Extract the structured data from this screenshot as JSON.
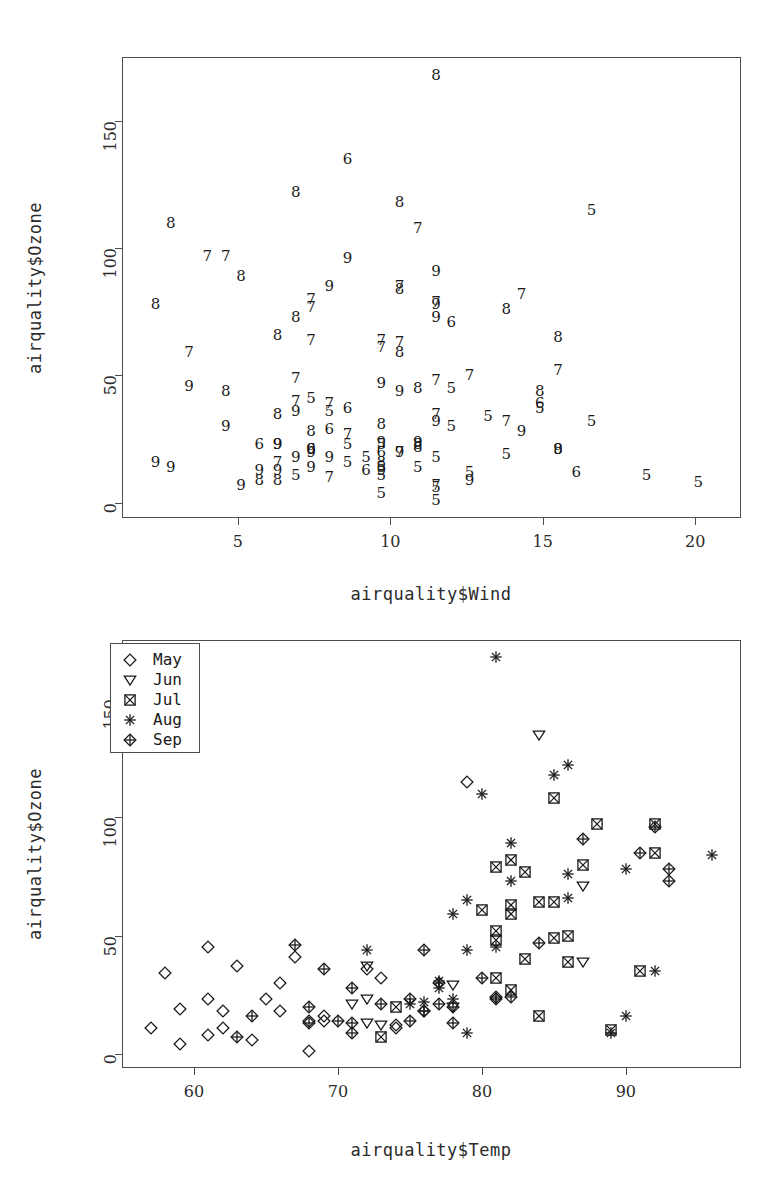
{
  "top_note": "",
  "chart_data": [
    {
      "type": "scatter",
      "id": "ozone-vs-wind",
      "title": "",
      "xlabel": "airquality$Wind",
      "ylabel": "airquality$Ozone",
      "xlim": [
        1.2,
        21.5
      ],
      "ylim": [
        -6,
        175
      ],
      "xticks": [
        5,
        10,
        15,
        20
      ],
      "yticks": [
        0,
        50,
        100,
        150
      ],
      "grid": false,
      "marker_style": "month-number-glyph",
      "note": "plot character is the month number (5=May .. 9=Sep)",
      "points": [
        {
          "x": 7.4,
          "y": 41,
          "m": 5
        },
        {
          "x": 8.0,
          "y": 36,
          "m": 5
        },
        {
          "x": 12.6,
          "y": 12,
          "m": 5
        },
        {
          "x": 11.5,
          "y": 18,
          "m": 5
        },
        {
          "x": 8.6,
          "y": 23,
          "m": 5
        },
        {
          "x": 13.8,
          "y": 19,
          "m": 5
        },
        {
          "x": 20.1,
          "y": 8,
          "m": 5
        },
        {
          "x": 8.6,
          "y": 16,
          "m": 5
        },
        {
          "x": 6.9,
          "y": 11,
          "m": 5
        },
        {
          "x": 9.7,
          "y": 14,
          "m": 5
        },
        {
          "x": 9.2,
          "y": 18,
          "m": 5
        },
        {
          "x": 10.9,
          "y": 14,
          "m": 5
        },
        {
          "x": 13.2,
          "y": 34,
          "m": 5
        },
        {
          "x": 11.5,
          "y": 6,
          "m": 5
        },
        {
          "x": 12.0,
          "y": 30,
          "m": 5
        },
        {
          "x": 18.4,
          "y": 11,
          "m": 5
        },
        {
          "x": 11.5,
          "y": 1,
          "m": 5
        },
        {
          "x": 9.7,
          "y": 11,
          "m": 5
        },
        {
          "x": 9.7,
          "y": 4,
          "m": 5
        },
        {
          "x": 16.6,
          "y": 32,
          "m": 5
        },
        {
          "x": 9.7,
          "y": 23,
          "m": 5
        },
        {
          "x": 12.0,
          "y": 45,
          "m": 5
        },
        {
          "x": 16.6,
          "y": 115,
          "m": 5
        },
        {
          "x": 14.9,
          "y": 37,
          "m": 5
        },
        {
          "x": 8.0,
          "y": 29,
          "m": 6
        },
        {
          "x": 12.0,
          "y": 71,
          "m": 6
        },
        {
          "x": 14.9,
          "y": 39,
          "m": 6
        },
        {
          "x": 5.7,
          "y": 23,
          "m": 6
        },
        {
          "x": 7.4,
          "y": 21,
          "m": 6
        },
        {
          "x": 8.6,
          "y": 37,
          "m": 6
        },
        {
          "x": 9.7,
          "y": 20,
          "m": 6
        },
        {
          "x": 16.1,
          "y": 12,
          "m": 6
        },
        {
          "x": 9.2,
          "y": 13,
          "m": 6
        },
        {
          "x": 8.6,
          "y": 135,
          "m": 6
        },
        {
          "x": 6.9,
          "y": 49,
          "m": 7
        },
        {
          "x": 13.8,
          "y": 32,
          "m": 7
        },
        {
          "x": 7.4,
          "y": 64,
          "m": 7
        },
        {
          "x": 6.9,
          "y": 40,
          "m": 7
        },
        {
          "x": 7.4,
          "y": 77,
          "m": 7
        },
        {
          "x": 4.6,
          "y": 97,
          "m": 7
        },
        {
          "x": 4.0,
          "y": 97,
          "m": 7
        },
        {
          "x": 10.3,
          "y": 85,
          "m": 7
        },
        {
          "x": 8.0,
          "y": 10,
          "m": 7
        },
        {
          "x": 8.6,
          "y": 27,
          "m": 7
        },
        {
          "x": 11.5,
          "y": 7,
          "m": 7
        },
        {
          "x": 11.5,
          "y": 48,
          "m": 7
        },
        {
          "x": 11.5,
          "y": 35,
          "m": 7
        },
        {
          "x": 9.7,
          "y": 61,
          "m": 7
        },
        {
          "x": 11.5,
          "y": 79,
          "m": 7
        },
        {
          "x": 10.3,
          "y": 63,
          "m": 7
        },
        {
          "x": 6.3,
          "y": 16,
          "m": 7
        },
        {
          "x": 7.4,
          "y": 80,
          "m": 7
        },
        {
          "x": 10.9,
          "y": 108,
          "m": 7
        },
        {
          "x": 10.3,
          "y": 20,
          "m": 7
        },
        {
          "x": 15.5,
          "y": 52,
          "m": 7
        },
        {
          "x": 14.3,
          "y": 82,
          "m": 7
        },
        {
          "x": 12.6,
          "y": 50,
          "m": 7
        },
        {
          "x": 9.7,
          "y": 64,
          "m": 7
        },
        {
          "x": 3.4,
          "y": 59,
          "m": 7
        },
        {
          "x": 8.0,
          "y": 39,
          "m": 7
        },
        {
          "x": 5.7,
          "y": 9,
          "m": 8
        },
        {
          "x": 9.7,
          "y": 16,
          "m": 8
        },
        {
          "x": 2.3,
          "y": 78,
          "m": 8
        },
        {
          "x": 6.3,
          "y": 35,
          "m": 8
        },
        {
          "x": 6.3,
          "y": 66,
          "m": 8
        },
        {
          "x": 6.9,
          "y": 122,
          "m": 8
        },
        {
          "x": 5.1,
          "y": 89,
          "m": 8
        },
        {
          "x": 2.8,
          "y": 110,
          "m": 8
        },
        {
          "x": 4.6,
          "y": 44,
          "m": 8
        },
        {
          "x": 7.4,
          "y": 28,
          "m": 8
        },
        {
          "x": 15.5,
          "y": 65,
          "m": 8
        },
        {
          "x": 10.9,
          "y": 22,
          "m": 8
        },
        {
          "x": 10.3,
          "y": 59,
          "m": 8
        },
        {
          "x": 10.9,
          "y": 23,
          "m": 8
        },
        {
          "x": 9.7,
          "y": 31,
          "m": 8
        },
        {
          "x": 14.9,
          "y": 44,
          "m": 8
        },
        {
          "x": 15.5,
          "y": 21,
          "m": 8
        },
        {
          "x": 6.3,
          "y": 9,
          "m": 8
        },
        {
          "x": 10.9,
          "y": 45,
          "m": 8
        },
        {
          "x": 11.5,
          "y": 168,
          "m": 8
        },
        {
          "x": 6.9,
          "y": 73,
          "m": 8
        },
        {
          "x": 13.8,
          "y": 76,
          "m": 8
        },
        {
          "x": 10.3,
          "y": 118,
          "m": 8
        },
        {
          "x": 10.3,
          "y": 84,
          "m": 8
        },
        {
          "x": 8.0,
          "y": 85,
          "m": 9
        },
        {
          "x": 8.6,
          "y": 96,
          "m": 9
        },
        {
          "x": 11.5,
          "y": 78,
          "m": 9
        },
        {
          "x": 11.5,
          "y": 73,
          "m": 9
        },
        {
          "x": 11.5,
          "y": 91,
          "m": 9
        },
        {
          "x": 9.7,
          "y": 47,
          "m": 9
        },
        {
          "x": 11.5,
          "y": 32,
          "m": 9
        },
        {
          "x": 10.3,
          "y": 20,
          "m": 9
        },
        {
          "x": 6.3,
          "y": 23,
          "m": 9
        },
        {
          "x": 7.4,
          "y": 21,
          "m": 9
        },
        {
          "x": 10.9,
          "y": 24,
          "m": 9
        },
        {
          "x": 10.3,
          "y": 44,
          "m": 9
        },
        {
          "x": 15.5,
          "y": 21,
          "m": 9
        },
        {
          "x": 14.3,
          "y": 28,
          "m": 9
        },
        {
          "x": 12.6,
          "y": 9,
          "m": 9
        },
        {
          "x": 9.7,
          "y": 13,
          "m": 9
        },
        {
          "x": 3.4,
          "y": 46,
          "m": 9
        },
        {
          "x": 8.0,
          "y": 18,
          "m": 9
        },
        {
          "x": 5.7,
          "y": 13,
          "m": 9
        },
        {
          "x": 9.7,
          "y": 24,
          "m": 9
        },
        {
          "x": 2.3,
          "y": 16,
          "m": 9
        },
        {
          "x": 6.3,
          "y": 13,
          "m": 9
        },
        {
          "x": 6.3,
          "y": 23,
          "m": 9
        },
        {
          "x": 6.9,
          "y": 36,
          "m": 9
        },
        {
          "x": 5.1,
          "y": 7,
          "m": 9
        },
        {
          "x": 2.8,
          "y": 14,
          "m": 9
        },
        {
          "x": 4.6,
          "y": 30,
          "m": 9
        },
        {
          "x": 7.4,
          "y": 14,
          "m": 9
        },
        {
          "x": 6.9,
          "y": 18,
          "m": 9
        },
        {
          "x": 7.4,
          "y": 20,
          "m": 9
        }
      ]
    },
    {
      "type": "scatter",
      "id": "ozone-vs-temp",
      "title": "",
      "xlabel": "airquality$Temp",
      "ylabel": "airquality$Ozone",
      "xlim": [
        55,
        98
      ],
      "ylim": [
        -6,
        175
      ],
      "xticks": [
        60,
        70,
        80,
        90
      ],
      "yticks": [
        0,
        50,
        100,
        150
      ],
      "grid": false,
      "legend": {
        "position": "topleft",
        "entries": [
          {
            "label": "May",
            "symbol": "diamond",
            "month": 5
          },
          {
            "label": "Jun",
            "symbol": "triangle-down",
            "month": 6
          },
          {
            "label": "Jul",
            "symbol": "square-x",
            "month": 7
          },
          {
            "label": "Aug",
            "symbol": "asterisk",
            "month": 8
          },
          {
            "label": "Sep",
            "symbol": "diamond-plus",
            "month": 9
          }
        ]
      },
      "points": [
        {
          "x": 67,
          "y": 41,
          "m": 5
        },
        {
          "x": 72,
          "y": 36,
          "m": 5
        },
        {
          "x": 74,
          "y": 12,
          "m": 5
        },
        {
          "x": 62,
          "y": 18,
          "m": 5
        },
        {
          "x": 65,
          "y": 23,
          "m": 5
        },
        {
          "x": 59,
          "y": 19,
          "m": 5
        },
        {
          "x": 61,
          "y": 8,
          "m": 5
        },
        {
          "x": 69,
          "y": 16,
          "m": 5
        },
        {
          "x": 74,
          "y": 11,
          "m": 5
        },
        {
          "x": 69,
          "y": 14,
          "m": 5
        },
        {
          "x": 66,
          "y": 18,
          "m": 5
        },
        {
          "x": 68,
          "y": 14,
          "m": 5
        },
        {
          "x": 58,
          "y": 34,
          "m": 5
        },
        {
          "x": 64,
          "y": 6,
          "m": 5
        },
        {
          "x": 66,
          "y": 30,
          "m": 5
        },
        {
          "x": 57,
          "y": 11,
          "m": 5
        },
        {
          "x": 68,
          "y": 1,
          "m": 5
        },
        {
          "x": 62,
          "y": 11,
          "m": 5
        },
        {
          "x": 59,
          "y": 4,
          "m": 5
        },
        {
          "x": 73,
          "y": 32,
          "m": 5
        },
        {
          "x": 61,
          "y": 23,
          "m": 5
        },
        {
          "x": 61,
          "y": 45,
          "m": 5
        },
        {
          "x": 79,
          "y": 115,
          "m": 5
        },
        {
          "x": 63,
          "y": 37,
          "m": 5
        },
        {
          "x": 78,
          "y": 29,
          "m": 6
        },
        {
          "x": 87,
          "y": 71,
          "m": 6
        },
        {
          "x": 87,
          "y": 39,
          "m": 6
        },
        {
          "x": 72,
          "y": 23,
          "m": 6
        },
        {
          "x": 71,
          "y": 21,
          "m": 6
        },
        {
          "x": 72,
          "y": 37,
          "m": 6
        },
        {
          "x": 78,
          "y": 20,
          "m": 6
        },
        {
          "x": 73,
          "y": 12,
          "m": 6
        },
        {
          "x": 72,
          "y": 13,
          "m": 6
        },
        {
          "x": 84,
          "y": 135,
          "m": 6
        },
        {
          "x": 85,
          "y": 49,
          "m": 7
        },
        {
          "x": 81,
          "y": 32,
          "m": 7
        },
        {
          "x": 84,
          "y": 64,
          "m": 7
        },
        {
          "x": 83,
          "y": 40,
          "m": 7
        },
        {
          "x": 83,
          "y": 77,
          "m": 7
        },
        {
          "x": 88,
          "y": 97,
          "m": 7
        },
        {
          "x": 92,
          "y": 97,
          "m": 7
        },
        {
          "x": 92,
          "y": 85,
          "m": 7
        },
        {
          "x": 89,
          "y": 10,
          "m": 7
        },
        {
          "x": 82,
          "y": 27,
          "m": 7
        },
        {
          "x": 73,
          "y": 7,
          "m": 7
        },
        {
          "x": 81,
          "y": 48,
          "m": 7
        },
        {
          "x": 91,
          "y": 35,
          "m": 7
        },
        {
          "x": 80,
          "y": 61,
          "m": 7
        },
        {
          "x": 81,
          "y": 79,
          "m": 7
        },
        {
          "x": 82,
          "y": 63,
          "m": 7
        },
        {
          "x": 84,
          "y": 16,
          "m": 7
        },
        {
          "x": 87,
          "y": 80,
          "m": 7
        },
        {
          "x": 85,
          "y": 108,
          "m": 7
        },
        {
          "x": 74,
          "y": 20,
          "m": 7
        },
        {
          "x": 81,
          "y": 52,
          "m": 7
        },
        {
          "x": 82,
          "y": 82,
          "m": 7
        },
        {
          "x": 86,
          "y": 50,
          "m": 7
        },
        {
          "x": 85,
          "y": 64,
          "m": 7
        },
        {
          "x": 82,
          "y": 59,
          "m": 7
        },
        {
          "x": 86,
          "y": 39,
          "m": 7
        },
        {
          "x": 89,
          "y": 9,
          "m": 8
        },
        {
          "x": 90,
          "y": 16,
          "m": 8
        },
        {
          "x": 90,
          "y": 78,
          "m": 8
        },
        {
          "x": 92,
          "y": 35,
          "m": 8
        },
        {
          "x": 86,
          "y": 66,
          "m": 8
        },
        {
          "x": 86,
          "y": 122,
          "m": 8
        },
        {
          "x": 82,
          "y": 89,
          "m": 8
        },
        {
          "x": 80,
          "y": 110,
          "m": 8
        },
        {
          "x": 79,
          "y": 44,
          "m": 8
        },
        {
          "x": 77,
          "y": 28,
          "m": 8
        },
        {
          "x": 79,
          "y": 65,
          "m": 8
        },
        {
          "x": 76,
          "y": 22,
          "m": 8
        },
        {
          "x": 78,
          "y": 59,
          "m": 8
        },
        {
          "x": 78,
          "y": 23,
          "m": 8
        },
        {
          "x": 77,
          "y": 31,
          "m": 8
        },
        {
          "x": 72,
          "y": 44,
          "m": 8
        },
        {
          "x": 75,
          "y": 21,
          "m": 8
        },
        {
          "x": 79,
          "y": 9,
          "m": 8
        },
        {
          "x": 81,
          "y": 45,
          "m": 8
        },
        {
          "x": 81,
          "y": 168,
          "m": 8
        },
        {
          "x": 82,
          "y": 73,
          "m": 8
        },
        {
          "x": 86,
          "y": 76,
          "m": 8
        },
        {
          "x": 85,
          "y": 118,
          "m": 8
        },
        {
          "x": 96,
          "y": 84,
          "m": 8
        },
        {
          "x": 91,
          "y": 85,
          "m": 9
        },
        {
          "x": 92,
          "y": 96,
          "m": 9
        },
        {
          "x": 93,
          "y": 78,
          "m": 9
        },
        {
          "x": 93,
          "y": 73,
          "m": 9
        },
        {
          "x": 87,
          "y": 91,
          "m": 9
        },
        {
          "x": 84,
          "y": 47,
          "m": 9
        },
        {
          "x": 80,
          "y": 32,
          "m": 9
        },
        {
          "x": 78,
          "y": 20,
          "m": 9
        },
        {
          "x": 75,
          "y": 23,
          "m": 9
        },
        {
          "x": 73,
          "y": 21,
          "m": 9
        },
        {
          "x": 81,
          "y": 24,
          "m": 9
        },
        {
          "x": 76,
          "y": 44,
          "m": 9
        },
        {
          "x": 77,
          "y": 21,
          "m": 9
        },
        {
          "x": 71,
          "y": 28,
          "m": 9
        },
        {
          "x": 71,
          "y": 9,
          "m": 9
        },
        {
          "x": 78,
          "y": 13,
          "m": 9
        },
        {
          "x": 67,
          "y": 46,
          "m": 9
        },
        {
          "x": 76,
          "y": 18,
          "m": 9
        },
        {
          "x": 68,
          "y": 13,
          "m": 9
        },
        {
          "x": 82,
          "y": 24,
          "m": 9
        },
        {
          "x": 64,
          "y": 16,
          "m": 9
        },
        {
          "x": 71,
          "y": 13,
          "m": 9
        },
        {
          "x": 81,
          "y": 23,
          "m": 9
        },
        {
          "x": 69,
          "y": 36,
          "m": 9
        },
        {
          "x": 63,
          "y": 7,
          "m": 9
        },
        {
          "x": 70,
          "y": 14,
          "m": 9
        },
        {
          "x": 77,
          "y": 30,
          "m": 9
        },
        {
          "x": 75,
          "y": 14,
          "m": 9
        },
        {
          "x": 76,
          "y": 18,
          "m": 9
        },
        {
          "x": 68,
          "y": 20,
          "m": 9
        }
      ]
    }
  ]
}
